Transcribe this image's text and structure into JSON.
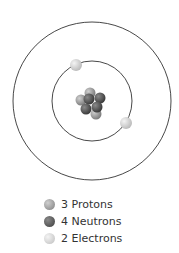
{
  "diagram": {
    "center": [
      92,
      101
    ],
    "outer_orbit_radius": 79,
    "inner_orbit_radius": 40,
    "orbit_color": "#333333",
    "colors": {
      "proton": "#9a9a9a",
      "neutron": "#5a5a5a",
      "electron": "#d9d9d9"
    }
  },
  "legend": {
    "items": [
      {
        "label": "3 Protons",
        "color": "#9a9a9a"
      },
      {
        "label": "4 Neutrons",
        "color": "#5a5a5a"
      },
      {
        "label": "2 Electrons",
        "color": "#d9d9d9"
      }
    ]
  }
}
